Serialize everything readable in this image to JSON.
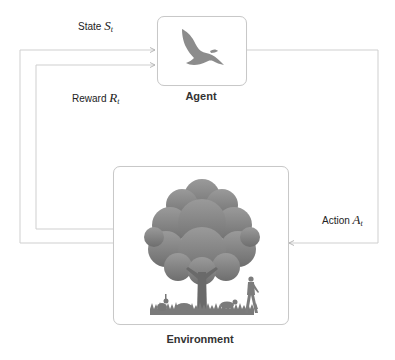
{
  "diagram": {
    "type": "reinforcement-learning-loop",
    "nodes": {
      "agent": {
        "label": "Agent",
        "icon": "bird-icon"
      },
      "environment": {
        "label": "Environment",
        "icon": "tree-scene-icon"
      }
    },
    "edges": {
      "state": {
        "label": "State",
        "symbol": "S",
        "subscript": "t",
        "from": "environment",
        "to": "agent"
      },
      "reward": {
        "label": "Reward",
        "symbol": "R",
        "subscript": "t",
        "from": "environment",
        "to": "agent"
      },
      "action": {
        "label": "Action",
        "symbol": "A",
        "subscript": "t",
        "from": "agent",
        "to": "environment"
      }
    },
    "colors": {
      "line": "#c8c8c8",
      "icon": "#8a8a8a",
      "text": "#222222"
    }
  }
}
